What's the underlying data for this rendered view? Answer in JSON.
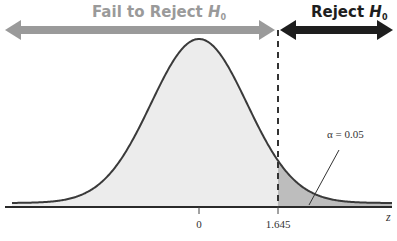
{
  "chart_data": {
    "type": "area",
    "title": "",
    "xlabel": "z",
    "ylabel": "",
    "distribution": "standard normal",
    "mean": 0,
    "critical_value": 1.645,
    "alpha": 0.05,
    "tick_labels": [
      "0",
      "1.645"
    ],
    "regions": [
      {
        "name": "Fail to Reject H0",
        "range": [
          "-inf",
          1.645
        ],
        "color": "#9a9a9a"
      },
      {
        "name": "Reject H0",
        "range": [
          1.645,
          "inf"
        ],
        "color": "#1e1e1e"
      }
    ],
    "annotations": [
      "α = 0.05"
    ],
    "grid": false,
    "legend": "none"
  },
  "labels": {
    "fail_region_main": "Fail to Reject ",
    "fail_region_h": "H",
    "fail_region_sub": "0",
    "reject_region_main": "Reject ",
    "reject_region_h": "H",
    "reject_region_sub": "0",
    "alpha_annotation": "α = 0.05",
    "tick_zero": "0",
    "tick_critical": "1.645",
    "axis_label": "z"
  },
  "colors": {
    "fail_arrow": "#9a9a9a",
    "reject_arrow": "#1e1e1e",
    "curve_fill": "#ececec",
    "tail_fill": "#bdbdbd",
    "curve_stroke": "#3a3a3a"
  }
}
